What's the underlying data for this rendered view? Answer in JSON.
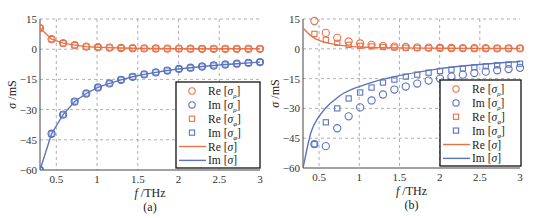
{
  "chart_data": [
    {
      "type": "line",
      "panel_label": "(a)",
      "xlabel": "f / THz",
      "ylabel": "σ / mS",
      "xlim": [
        0.3,
        3
      ],
      "ylim": [
        -60,
        15
      ],
      "xticks": [
        "0.5",
        "1",
        "1.5",
        "2",
        "2.5",
        "3"
      ],
      "yticks": [
        "15",
        "0",
        "-15",
        "-30",
        "-45",
        "-60"
      ],
      "grid": true,
      "legend_position": "lower right",
      "x": [
        0.3,
        0.442,
        0.584,
        0.726,
        0.868,
        1.011,
        1.153,
        1.295,
        1.437,
        1.579,
        1.721,
        1.863,
        2.005,
        2.147,
        2.289,
        2.432,
        2.574,
        2.716,
        2.858,
        3.0
      ],
      "series": [
        {
          "name": "Re [σρ]",
          "marker": "circle",
          "color": "#e8734a",
          "values": [
            10.5,
            5.0,
            3.0,
            2.0,
            1.3,
            1.0,
            0.8,
            0.6,
            0.5,
            0.4,
            0.35,
            0.3,
            0.3,
            0.25,
            0.2,
            0.2,
            0.2,
            0.2,
            0.2,
            0.2
          ]
        },
        {
          "name": "Im [σρ]",
          "marker": "circle",
          "color": "#5b74c0",
          "values": [
            -60,
            -42,
            -32.5,
            -26,
            -22,
            -19,
            -17,
            -15.2,
            -13.7,
            -12.5,
            -11.5,
            -10.6,
            -9.8,
            -9.2,
            -8.6,
            -8.1,
            -7.6,
            -7.2,
            -6.8,
            -6.4
          ]
        },
        {
          "name": "Re [σφ]",
          "marker": "square",
          "color": "#e8734a",
          "values": [
            10.5,
            5.0,
            3.0,
            2.0,
            1.3,
            1.0,
            0.8,
            0.6,
            0.5,
            0.4,
            0.35,
            0.3,
            0.3,
            0.25,
            0.2,
            0.2,
            0.2,
            0.2,
            0.2,
            0.2
          ]
        },
        {
          "name": "Im [σφ]",
          "marker": "square",
          "color": "#5b74c0",
          "values": [
            -60,
            -42,
            -32.5,
            -26,
            -22,
            -19,
            -17,
            -15.2,
            -13.7,
            -12.5,
            -11.5,
            -10.6,
            -9.8,
            -9.2,
            -8.6,
            -8.1,
            -7.6,
            -7.2,
            -6.8,
            -6.4
          ]
        },
        {
          "name": "Re [σ]",
          "marker": "line",
          "color": "#e8734a",
          "values": [
            10.5,
            5.0,
            3.0,
            2.0,
            1.3,
            1.0,
            0.8,
            0.6,
            0.5,
            0.4,
            0.35,
            0.3,
            0.3,
            0.25,
            0.2,
            0.2,
            0.2,
            0.2,
            0.2,
            0.2
          ]
        },
        {
          "name": "Im [σ]",
          "marker": "line",
          "color": "#5b74c0",
          "values": [
            -60,
            -42,
            -32.5,
            -26,
            -22,
            -19,
            -17,
            -15.2,
            -13.7,
            -12.5,
            -11.5,
            -10.6,
            -9.8,
            -9.2,
            -8.6,
            -8.1,
            -7.6,
            -7.2,
            -6.8,
            -6.4
          ]
        }
      ]
    },
    {
      "type": "line",
      "panel_label": "(b)",
      "xlabel": "f / THz",
      "ylabel": "σ / mS",
      "xlim": [
        0.3,
        3
      ],
      "ylim": [
        -60,
        15
      ],
      "xticks": [
        "0.5",
        "1",
        "1.5",
        "2",
        "2.5",
        "3"
      ],
      "yticks": [
        "15",
        "0",
        "-15",
        "-30",
        "-45",
        "-60"
      ],
      "grid": true,
      "legend_position": "lower right",
      "x": [
        0.442,
        0.584,
        0.726,
        0.868,
        1.011,
        1.153,
        1.295,
        1.437,
        1.579,
        1.721,
        1.863,
        2.005,
        2.147,
        2.289,
        2.432,
        2.574,
        2.716,
        2.858,
        3.0
      ],
      "series": [
        {
          "name": "Re [σρ]",
          "marker": "circle",
          "color": "#e8734a",
          "values": [
            14,
            8,
            5.5,
            3.7,
            2.7,
            2.0,
            1.5,
            1.1,
            0.9,
            0.7,
            0.6,
            0.5,
            0.4,
            0.35,
            0.3,
            0.3,
            0.25,
            0.25,
            0.2
          ]
        },
        {
          "name": "Im [σρ]",
          "marker": "circle",
          "color": "#5b74c0",
          "values": [
            -48,
            -49,
            -40,
            -34,
            -29.5,
            -26,
            -23,
            -20.5,
            -19,
            -17.5,
            -16,
            -15,
            -14,
            -13,
            -12.2,
            -11.5,
            -10.8,
            -10.2,
            -9.6
          ]
        },
        {
          "name": "Re [σφ]",
          "marker": "square",
          "color": "#e8734a",
          "values": [
            7.5,
            4.5,
            3.0,
            2.0,
            1.5,
            1.2,
            0.9,
            0.7,
            0.5,
            0.45,
            0.4,
            0.35,
            0.3,
            0.3,
            0.25,
            0.25,
            0.2,
            0.2,
            0.2
          ]
        },
        {
          "name": "Im [σφ]",
          "marker": "square",
          "color": "#5b74c0",
          "values": [
            -48,
            -37,
            -30,
            -25,
            -22,
            -19.5,
            -17,
            -15.5,
            -14,
            -13,
            -12,
            -11.2,
            -10.5,
            -9.9,
            -9.3,
            -8.8,
            -8.3,
            -7.9,
            -7.5
          ]
        },
        {
          "name": "Re [σ]",
          "marker": "line",
          "color": "#e8734a",
          "x": [
            0.3,
            0.4,
            0.5,
            0.6,
            0.7,
            0.8,
            0.9,
            1.0,
            1.25,
            1.5,
            2.0,
            2.5,
            3.0
          ],
          "values": [
            10.5,
            6.5,
            4.2,
            3.0,
            2.2,
            1.6,
            1.2,
            0.9,
            0.6,
            0.45,
            0.3,
            0.22,
            0.2
          ]
        },
        {
          "name": "Im [σ]",
          "marker": "line",
          "color": "#5b74c0",
          "x": [
            0.3,
            0.4,
            0.5,
            0.6,
            0.7,
            0.8,
            0.9,
            1.0,
            1.25,
            1.5,
            2.0,
            2.5,
            3.0
          ],
          "values": [
            -60,
            -42,
            -34,
            -29,
            -25.5,
            -22.5,
            -20.5,
            -19,
            -15.8,
            -13.5,
            -10,
            -7.9,
            -6.4
          ]
        }
      ]
    }
  ],
  "panels": [
    {
      "label": "(a)",
      "xlabel_f": "f",
      "xlabel_unit": "/THz",
      "ylabel_sigma": "σ",
      "ylabel_unit": "/mS"
    },
    {
      "label": "(b)",
      "xlabel_f": "f",
      "xlabel_unit": "/THz",
      "ylabel_sigma": "σ",
      "ylabel_unit": "/mS"
    }
  ],
  "legend": [
    {
      "prefix": "Re",
      "sub": "ρ",
      "marker": "circle",
      "color": "#e8734a"
    },
    {
      "prefix": "Im",
      "sub": "ρ",
      "marker": "circle",
      "color": "#5b74c0"
    },
    {
      "prefix": "Re",
      "sub": "φ",
      "marker": "square",
      "color": "#e8734a"
    },
    {
      "prefix": "Im",
      "sub": "φ",
      "marker": "square",
      "color": "#5b74c0"
    },
    {
      "prefix": "Re",
      "sub": "",
      "marker": "line",
      "color": "#e8734a"
    },
    {
      "prefix": "Im",
      "sub": "",
      "marker": "line",
      "color": "#5b74c0"
    }
  ],
  "colors": {
    "re": "#e8734a",
    "im": "#5b74c0",
    "grid": "#9a9a9a",
    "axis": "#444444"
  }
}
